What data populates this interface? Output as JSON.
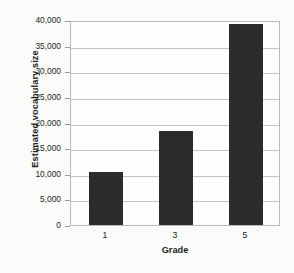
{
  "chart_data": {
    "type": "bar",
    "title": "",
    "xlabel": "Grade",
    "ylabel": "Estimated vocabulary size",
    "categories": [
      "1",
      "3",
      "5"
    ],
    "values": [
      10400,
      18300,
      39200
    ],
    "ylim": [
      0,
      40000
    ],
    "ytick_values": [
      0,
      5000,
      10000,
      15000,
      20000,
      25000,
      30000,
      35000,
      40000
    ],
    "ytick_labels": [
      "0",
      "5,000",
      "10,000",
      "15,000",
      "20,000",
      "25,000",
      "30,000",
      "35,000",
      "40,000"
    ],
    "grid": true,
    "legend": false,
    "bar_color": "#2b2b2b",
    "grid_color": "#c3c3c3",
    "frame_color": "#b9b9b9",
    "background_color": "#fbfbfa"
  }
}
